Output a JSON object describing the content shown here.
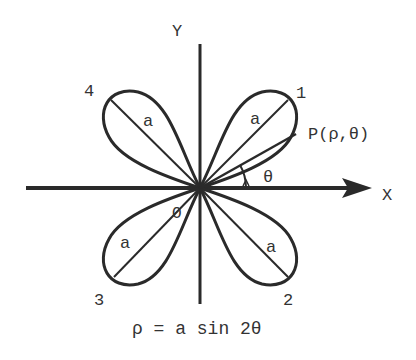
{
  "diagram": {
    "equation": "ρ = a sin 2θ",
    "axes": {
      "x_label": "X",
      "y_label": "Y",
      "origin_label": "O"
    },
    "petals": [
      {
        "number": "1",
        "radius_label": "a",
        "quadrant": "I"
      },
      {
        "number": "2",
        "radius_label": "a",
        "quadrant": "IV"
      },
      {
        "number": "3",
        "radius_label": "a",
        "quadrant": "III"
      },
      {
        "number": "4",
        "radius_label": "a",
        "quadrant": "II"
      }
    ],
    "point_label": "P(ρ,θ)",
    "angle_label": "θ",
    "colors": {
      "stroke": "#2a2a2a",
      "text": "#333333",
      "background": "#ffffff"
    }
  }
}
